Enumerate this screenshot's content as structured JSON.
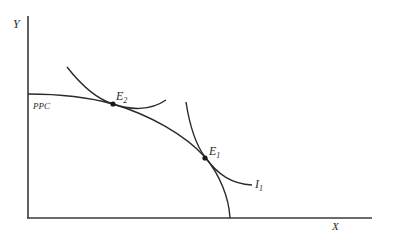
{
  "diagram": {
    "type": "production-possibility-and-indifference",
    "axes": {
      "y_label": "Y",
      "x_label": "X"
    },
    "curves": {
      "ppc_label": "PPC",
      "indifference_label_main": "I",
      "indifference_label_sub": "1"
    },
    "points": {
      "e1_main": "E",
      "e1_sub": "1",
      "e2_main": "E",
      "e2_sub": "2"
    },
    "colors": {
      "line": "#2a2a2a",
      "background": "#ffffff"
    }
  }
}
